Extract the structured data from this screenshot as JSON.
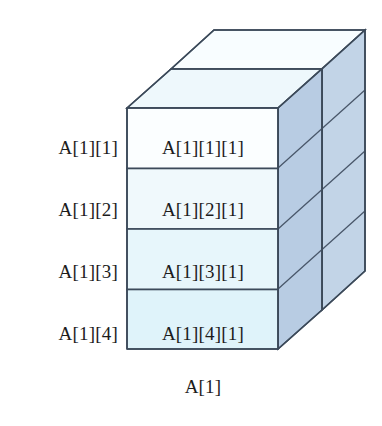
{
  "figure": {
    "caption": "A[1]",
    "row_labels": [
      "A[1][1]",
      "A[1][2]",
      "A[1][3]",
      "A[1][4]"
    ],
    "cells": [
      "A[1][1][1]",
      "A[1][2][1]",
      "A[1][3][1]",
      "A[1][4][1]"
    ],
    "colors": {
      "background": "#ffffff",
      "outline": "#3c4a5a",
      "front_cell_1": "#fbfeff",
      "front_cell_2": "#f0f9fc",
      "front_cell_3": "#e7f6fb",
      "front_cell_4": "#dff3fa",
      "top_face_front": "#eef8fc",
      "top_face_back": "#f7fdff",
      "side_face_near": "#b9cde4",
      "side_face_far": "#c3d4e8",
      "text": "#1c1c1c"
    },
    "geometry": {
      "front_left_x": 127,
      "front_right_x": 278,
      "front_top_y": 108,
      "front_bottom_y": 349,
      "depth_dx": 87,
      "depth_dy": -78,
      "rows": 4,
      "depth_slabs": 2
    }
  }
}
